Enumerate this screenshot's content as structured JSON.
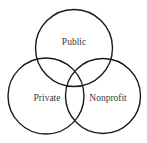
{
  "diagram": {
    "type": "venn",
    "circles": [
      {
        "label": "Public",
        "cx": 74,
        "cy": 48,
        "r": 38.5
      },
      {
        "label": "Private",
        "cx": 46,
        "cy": 96,
        "r": 38
      },
      {
        "label": "Nonprofit",
        "cx": 103,
        "cy": 96,
        "r": 37.5
      }
    ],
    "stroke_color": "#1a1a1a",
    "label_color": "#3a3a3a"
  }
}
